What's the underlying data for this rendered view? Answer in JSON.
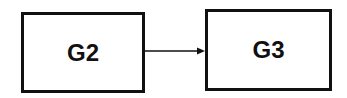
{
  "diagram": {
    "nodes": [
      {
        "id": "G2",
        "label": "G2"
      },
      {
        "id": "G3",
        "label": "G3"
      }
    ],
    "edges": [
      {
        "from": "G2",
        "to": "G3",
        "directed": true
      }
    ]
  }
}
